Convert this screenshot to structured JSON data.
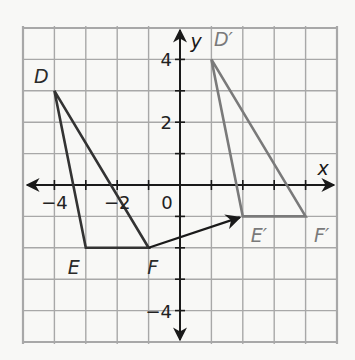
{
  "figure": {
    "type": "coordinate-plane-translation",
    "colors": {
      "background": "#f8f8f6",
      "grid": "#a8a8a8",
      "axes": "#1a1a1a",
      "original": "#333333",
      "image": "#7a7a7a",
      "arrow": "#1a1a1a"
    },
    "axes": {
      "x_label": "x",
      "y_label": "y",
      "x_range": [
        -5,
        5
      ],
      "y_range": [
        -5,
        5
      ],
      "x_ticks": [
        {
          "value": -4,
          "label": "−4"
        },
        {
          "value": -2,
          "label": "−2"
        }
      ],
      "y_ticks": [
        {
          "value": 4,
          "label": "4"
        },
        {
          "value": 2,
          "label": "2"
        },
        {
          "value": -4,
          "label": "−4"
        }
      ],
      "origin_label": "0"
    },
    "original_triangle": {
      "vertices": [
        {
          "name": "D",
          "label": "D",
          "x": -4,
          "y": 3
        },
        {
          "name": "E",
          "label": "E",
          "x": -3,
          "y": -2
        },
        {
          "name": "F",
          "label": "F",
          "x": -1,
          "y": -2
        }
      ]
    },
    "image_triangle": {
      "vertices": [
        {
          "name": "D'",
          "label": "D′",
          "x": 1,
          "y": 4
        },
        {
          "name": "E'",
          "label": "E′",
          "x": 2,
          "y": -1
        },
        {
          "name": "F'",
          "label": "F′",
          "x": 4,
          "y": -1
        }
      ]
    },
    "translation_arrow": {
      "from": {
        "x": -1,
        "y": -2
      },
      "to": {
        "x": 2,
        "y": -1
      }
    }
  }
}
